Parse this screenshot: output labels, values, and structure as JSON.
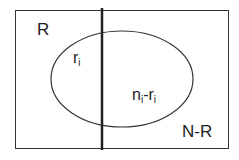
{
  "diagram": {
    "type": "venn-partition",
    "colors": {
      "stroke": "#333333",
      "background": "#ffffff",
      "text": "#222222"
    },
    "regions": {
      "left_label": "R",
      "right_label": "N-R"
    },
    "ellipse_labels": {
      "left": {
        "base": "r",
        "sub": "i"
      },
      "right": {
        "base1": "n",
        "sub1": "i",
        "sep": "-",
        "base2": "r",
        "sub2": "i"
      }
    }
  }
}
